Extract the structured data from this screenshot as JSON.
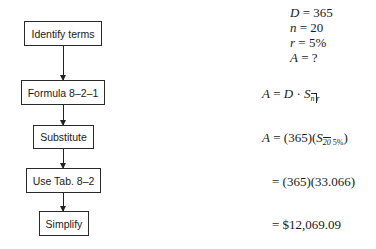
{
  "flowchart": {
    "steps": [
      {
        "label": "Identify terms"
      },
      {
        "label": "Formula 8–2–1"
      },
      {
        "label": "Substitute"
      },
      {
        "label": "Use Tab. 8–2"
      },
      {
        "label": "Simplify"
      }
    ]
  },
  "given": {
    "D": {
      "var": "D",
      "eq": " = ",
      "val": "365"
    },
    "n": {
      "var": "n",
      "eq": " = ",
      "val": "20"
    },
    "r": {
      "var": "r",
      "eq": " = ",
      "val": "5%"
    },
    "A": {
      "var": "A",
      "eq": " = ",
      "val": "?"
    }
  },
  "steps_math": {
    "formula": {
      "lhs": "A",
      "eq": " = ",
      "D": "D",
      "dot": " · ",
      "S": "S",
      "n": "n",
      "r": "r"
    },
    "substitute": {
      "lhs": "A",
      "eq": " = ",
      "pre": "(365)(",
      "S": "S",
      "n": "20",
      "r": "5%",
      "post": ")"
    },
    "table": {
      "text": "= (365)(33.066)"
    },
    "simplify": {
      "text": "= $12,069.09"
    }
  }
}
